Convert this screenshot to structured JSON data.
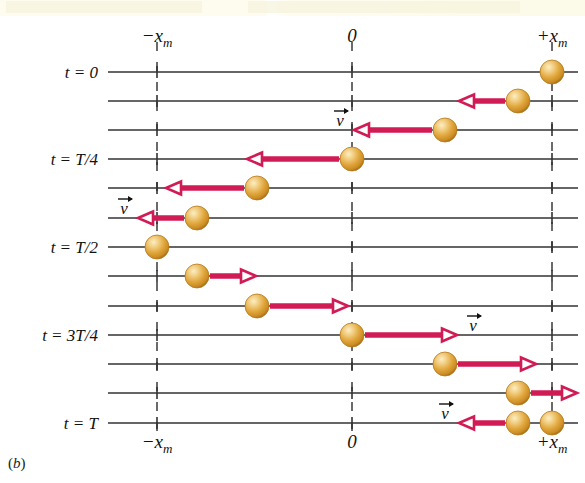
{
  "figure": {
    "panel_label": "b",
    "panel_label_open": "(",
    "panel_label_close": ")",
    "caption_band_present": true
  },
  "colors": {
    "ball_core": "#e2a33a",
    "ball_highlight": "#f6dca4",
    "ball_edge": "#b5791d",
    "arrow": "#d01b55",
    "axis_line": "#333333",
    "dashed_line": "#3a3a3a",
    "text": "#111111",
    "band": "#fdfcef"
  },
  "axis": {
    "top_labels": [
      {
        "text": "−x",
        "sub": "m",
        "x": 157
      },
      {
        "text": "0",
        "sub": "",
        "x": 352
      },
      {
        "text": "+x",
        "sub": "m",
        "x": 552
      }
    ],
    "bottom_labels": [
      {
        "text": "−x",
        "sub": "m",
        "x": 157
      },
      {
        "text": "0",
        "sub": "",
        "x": 352
      },
      {
        "text": "+x",
        "sub": "m",
        "x": 552
      }
    ],
    "x_min_px": 157,
    "x_zero_px": 352,
    "x_max_px": 552,
    "line_left_px": 108,
    "line_right_px": 578
  },
  "time_labels": [
    {
      "label": "t = 0",
      "row": 0,
      "y": 72
    },
    {
      "label": "t = T/4",
      "row": 3,
      "y": 159
    },
    {
      "label": "t = T/2",
      "row": 6,
      "y": 247
    },
    {
      "label": "t = 3T/4",
      "row": 9,
      "y": 335
    },
    {
      "label": "t = T",
      "row": 12,
      "y": 423
    }
  ],
  "chart_data": {
    "type": "scatter",
    "xlabel": "x",
    "ylabel": "t",
    "xlim": [
      -1,
      1
    ],
    "x_tick_labels": [
      "−x_m",
      "0",
      "+x_m"
    ],
    "x_tick_values": [
      -1,
      0,
      1
    ],
    "grid": false,
    "series": [
      {
        "name": "block position x(t) = x_m cos(2πt/T)",
        "t_fraction": [
          0,
          0.0833,
          0.1667,
          0.25,
          0.3333,
          0.4167,
          0.5,
          0.5833,
          0.6667,
          0.75,
          0.8333,
          0.9167,
          1.0
        ],
        "x_over_xm": [
          1.0,
          0.866,
          0.5,
          0.0,
          -0.5,
          -0.866,
          -1.0,
          -0.866,
          -0.5,
          0.0,
          0.5,
          0.866,
          1.0
        ],
        "velocity_sign": [
          0,
          -1,
          -1,
          -1,
          -1,
          -1,
          0,
          1,
          1,
          1,
          1,
          1,
          -1
        ]
      }
    ]
  },
  "rows": [
    {
      "index": 0,
      "y": 72,
      "ball_x": 552,
      "arrow": "none",
      "arrow_len": 0,
      "v_label": false,
      "v_label_side": ""
    },
    {
      "index": 1,
      "y": 101,
      "ball_x": 518,
      "arrow": "left",
      "arrow_len": 46,
      "v_label": false,
      "v_label_side": ""
    },
    {
      "index": 2,
      "y": 130,
      "ball_x": 445,
      "arrow": "left",
      "arrow_len": 78,
      "v_label": true,
      "v_label_side": "left"
    },
    {
      "index": 3,
      "y": 159,
      "ball_x": 352,
      "arrow": "left",
      "arrow_len": 92,
      "v_label": false,
      "v_label_side": ""
    },
    {
      "index": 4,
      "y": 188,
      "ball_x": 257,
      "arrow": "left",
      "arrow_len": 78,
      "v_label": false,
      "v_label_side": ""
    },
    {
      "index": 5,
      "y": 218,
      "ball_x": 197,
      "arrow": "left",
      "arrow_len": 46,
      "v_label": true,
      "v_label_side": "left"
    },
    {
      "index": 6,
      "y": 247,
      "ball_x": 157,
      "arrow": "none",
      "arrow_len": 0,
      "v_label": false,
      "v_label_side": ""
    },
    {
      "index": 7,
      "y": 276,
      "ball_x": 197,
      "arrow": "right",
      "arrow_len": 46,
      "v_label": false,
      "v_label_side": ""
    },
    {
      "index": 8,
      "y": 306,
      "ball_x": 257,
      "arrow": "right",
      "arrow_len": 78,
      "v_label": false,
      "v_label_side": ""
    },
    {
      "index": 9,
      "y": 335,
      "ball_x": 352,
      "arrow": "right",
      "arrow_len": 92,
      "v_label": true,
      "v_label_side": "right"
    },
    {
      "index": 10,
      "y": 364,
      "ball_x": 445,
      "arrow": "right",
      "arrow_len": 78,
      "v_label": false,
      "v_label_side": ""
    },
    {
      "index": 11,
      "y": 393,
      "ball_x": 518,
      "arrow": "right",
      "arrow_len": 46,
      "v_label": false,
      "v_label_side": ""
    },
    {
      "index": 12,
      "y": 423,
      "ball_x": 552,
      "arrow": "none",
      "arrow_len": 0,
      "v_label": false,
      "v_label_side": ""
    },
    {
      "index": 13,
      "y": 423,
      "ball_x": 518,
      "arrow": "left",
      "arrow_len": 46,
      "v_label": true,
      "v_label_side": "left",
      "overlay": true
    }
  ],
  "vector_symbol": {
    "letter": "v",
    "notation": "arrow-overbar",
    "name": "velocity-vector-label"
  },
  "ball_radius": 12
}
